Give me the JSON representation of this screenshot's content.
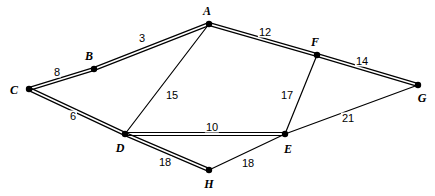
{
  "figure": {
    "kind": "weighted-graph-diagram",
    "background_color": "#ffffff",
    "stroke_color": "#000000",
    "width": 435,
    "height": 196
  },
  "chart_data": {
    "type": "diagram",
    "title": "",
    "subtitle": "",
    "xlabel": "",
    "ylabel": "",
    "grid": false,
    "legend": false,
    "nodes": [
      {
        "id": "A",
        "label": "A",
        "x": 209,
        "y": 24,
        "label_x": 207,
        "label_y": 11
      },
      {
        "id": "B",
        "label": "B",
        "x": 94,
        "y": 69,
        "label_x": 89,
        "label_y": 56
      },
      {
        "id": "C",
        "label": "C",
        "x": 29,
        "y": 89,
        "label_x": 14,
        "label_y": 90
      },
      {
        "id": "D",
        "label": "D",
        "x": 125,
        "y": 134,
        "label_x": 120,
        "label_y": 148
      },
      {
        "id": "E",
        "label": "E",
        "x": 285,
        "y": 134,
        "label_x": 288,
        "label_y": 149
      },
      {
        "id": "F",
        "label": "F",
        "x": 317,
        "y": 55,
        "label_x": 315,
        "label_y": 42
      },
      {
        "id": "G",
        "label": "G",
        "x": 418,
        "y": 85,
        "label_x": 422,
        "label_y": 98
      },
      {
        "id": "H",
        "label": "H",
        "x": 209,
        "y": 170,
        "label_x": 209,
        "label_y": 184
      }
    ],
    "edges": [
      {
        "id": "CB",
        "from": "C",
        "to": "B",
        "weight": "8",
        "style": "double",
        "label_x": 57,
        "label_y": 72
      },
      {
        "id": "BA",
        "from": "B",
        "to": "A",
        "weight": "3",
        "style": "double",
        "label_x": 142,
        "label_y": 38
      },
      {
        "id": "AF",
        "from": "A",
        "to": "F",
        "weight": "12",
        "style": "double",
        "label_x": 265,
        "label_y": 32
      },
      {
        "id": "FG",
        "from": "F",
        "to": "G",
        "weight": "14",
        "style": "double",
        "label_x": 362,
        "label_y": 61
      },
      {
        "id": "AD",
        "from": "A",
        "to": "D",
        "weight": "15",
        "style": "single",
        "label_x": 172,
        "label_y": 95
      },
      {
        "id": "CD",
        "from": "C",
        "to": "D",
        "weight": "6",
        "style": "double",
        "label_x": 73,
        "label_y": 116
      },
      {
        "id": "DE",
        "from": "D",
        "to": "E",
        "weight": "10",
        "style": "double",
        "label_x": 212,
        "label_y": 127
      },
      {
        "id": "FE",
        "from": "F",
        "to": "E",
        "weight": "17",
        "style": "single",
        "label_x": 287,
        "label_y": 95
      },
      {
        "id": "EG",
        "from": "E",
        "to": "G",
        "weight": "21",
        "style": "single",
        "label_x": 348,
        "label_y": 118
      },
      {
        "id": "DH",
        "from": "D",
        "to": "H",
        "weight": "18",
        "style": "double",
        "label_x": 165,
        "label_y": 162
      },
      {
        "id": "HE",
        "from": "H",
        "to": "E",
        "weight": "18",
        "style": "single",
        "label_x": 248,
        "label_y": 163
      }
    ]
  }
}
